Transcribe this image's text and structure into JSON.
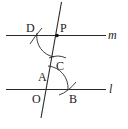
{
  "diagram": {
    "type": "geometric-construction",
    "lines": [
      {
        "name": "m",
        "label": "m"
      },
      {
        "name": "l",
        "label": "l"
      },
      {
        "name": "transversal",
        "label": ""
      }
    ],
    "points": [
      {
        "name": "P",
        "label": "P"
      },
      {
        "name": "D",
        "label": "D"
      },
      {
        "name": "C",
        "label": "C"
      },
      {
        "name": "A",
        "label": "A"
      },
      {
        "name": "O",
        "label": "O"
      },
      {
        "name": "B",
        "label": "B"
      }
    ],
    "colors": {
      "stroke": "#2a2a2a",
      "background": "#ffffff"
    }
  }
}
